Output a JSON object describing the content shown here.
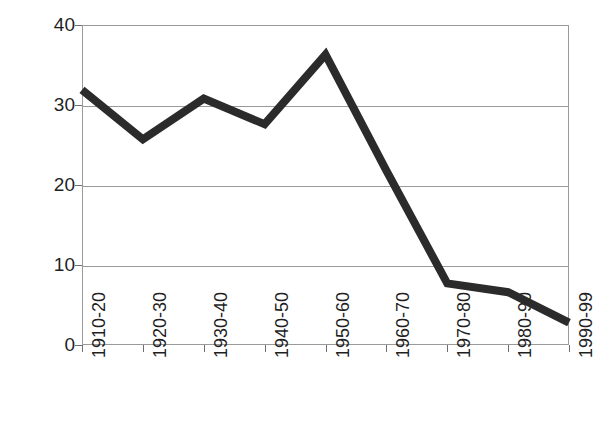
{
  "chart_data": {
    "type": "line",
    "title": "",
    "subtitle": "",
    "xlabel": "",
    "ylabel": "Millions of Deaths",
    "categories": [
      "1910-20",
      "1920-30",
      "1930-40",
      "1940-50",
      "1950-60",
      "1960-70",
      "1970-80",
      "1980-90",
      "1990-99"
    ],
    "values": [
      31.9,
      25.7,
      30.8,
      27.6,
      36.3,
      21.8,
      7.7,
      6.6,
      2.8
    ],
    "series": [
      {
        "name": "Millions of Deaths",
        "values": [
          31.9,
          25.7,
          30.8,
          27.6,
          36.3,
          21.8,
          7.7,
          6.6,
          2.8
        ],
        "color": "#2b2b2b",
        "line_width": 8,
        "markers": "none"
      }
    ],
    "ylim": [
      0,
      40
    ],
    "yticks": [
      0,
      10,
      20,
      30,
      40
    ],
    "ytick_labels": [
      "0",
      "10",
      "20",
      "30",
      "40"
    ],
    "grid": "horizontal",
    "legend": "none"
  },
  "axes": {
    "y_title": "Millions of Deaths",
    "y_tick_labels": [
      "40",
      "30",
      "20",
      "10",
      "0"
    ],
    "x_tick_labels": [
      "1910-20",
      "1920-30",
      "1930-40",
      "1940-50",
      "1950-60",
      "1960-70",
      "1970-80",
      "1980-90",
      "1990-99"
    ]
  },
  "style": {
    "line_color": "#2b2b2b",
    "grid_color": "#9a9a9a",
    "frame_color": "#9a9a9a",
    "text_color": "#1f1f1f",
    "background": "#ffffff"
  }
}
